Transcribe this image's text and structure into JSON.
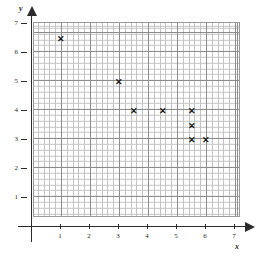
{
  "chart_data": {
    "type": "scatter",
    "title": "",
    "subtitle": "",
    "xlabel": "x",
    "ylabel": "y",
    "xlim": [
      0,
      7
    ],
    "ylim": [
      0,
      7
    ],
    "xticks": [
      1,
      2,
      3,
      4,
      5,
      6,
      7
    ],
    "yticks": [
      1,
      2,
      3,
      4,
      5,
      6,
      7
    ],
    "xtick_labels": [
      "1",
      "2",
      "3",
      "4",
      "5",
      "6",
      "7"
    ],
    "ytick_labels": [
      "1",
      "2",
      "3",
      "4",
      "5",
      "6",
      "7"
    ],
    "grid": true,
    "grid_minor_per_unit": 5,
    "legend": "none",
    "marker": "x",
    "marker_glyph": "✕",
    "marker_color": "#1a1a1a",
    "grid_color": "#8d8d8d",
    "grid_minor_color": "#c3c3c3",
    "axis_color": "#2b2b2b",
    "background_color": "#ffffff",
    "points": [
      {
        "x": 1,
        "y": 6.5
      },
      {
        "x": 3,
        "y": 5
      },
      {
        "x": 3.5,
        "y": 4
      },
      {
        "x": 4.5,
        "y": 4
      },
      {
        "x": 5.5,
        "y": 4
      },
      {
        "x": 5.5,
        "y": 3.5
      },
      {
        "x": 5.5,
        "y": 3
      },
      {
        "x": 6,
        "y": 3
      }
    ]
  },
  "figure": {
    "width": 263,
    "height": 274
  }
}
